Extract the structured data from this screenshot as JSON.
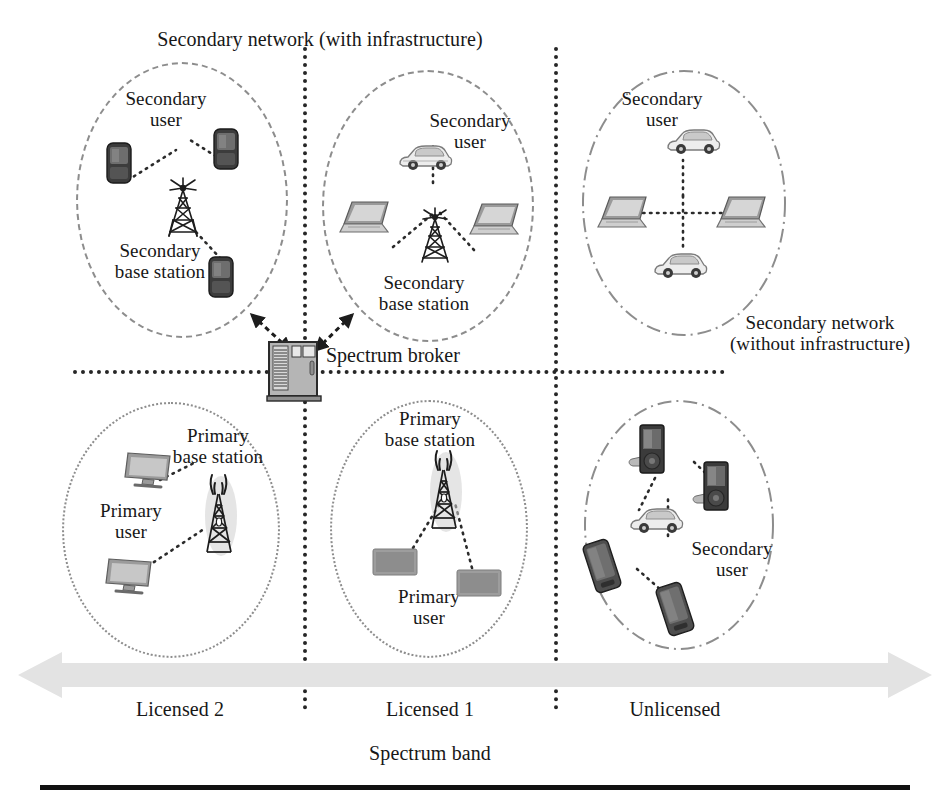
{
  "figure": {
    "title_top": "Secondary network (with infrastructure)",
    "axis_title": "Spectrum band",
    "broker_label": "Spectrum broker",
    "right_network_label": "Secondary network\n(without infrastructure)"
  },
  "bands": [
    {
      "id": "licensed-2",
      "label": "Licensed 2"
    },
    {
      "id": "licensed-1",
      "label": "Licensed 1"
    },
    {
      "id": "unlicensed",
      "label": "Unlicensed"
    }
  ],
  "cells": [
    {
      "id": "top-left",
      "band": "Licensed 2",
      "network_kind": "secondary-with-infrastructure",
      "labels": [
        {
          "id": "secondary-user",
          "text": "Secondary\nuser"
        },
        {
          "id": "secondary-base-station",
          "text": "Secondary\nbase station"
        }
      ],
      "nodes": [
        {
          "id": "phone-upper-left",
          "icon": "mobile-phone-icon"
        },
        {
          "id": "phone-upper-right",
          "icon": "mobile-phone-icon"
        },
        {
          "id": "phone-lower-right",
          "icon": "mobile-phone-icon"
        },
        {
          "id": "base-station",
          "icon": "antenna-tower-icon"
        }
      ]
    },
    {
      "id": "top-middle",
      "band": "Licensed 1",
      "network_kind": "secondary-with-infrastructure",
      "labels": [
        {
          "id": "secondary-user",
          "text": "Secondary\nuser"
        },
        {
          "id": "secondary-base-station",
          "text": "Secondary\nbase station"
        }
      ],
      "nodes": [
        {
          "id": "car-top",
          "icon": "car-icon"
        },
        {
          "id": "laptop-left",
          "icon": "laptop-icon"
        },
        {
          "id": "laptop-right",
          "icon": "laptop-icon"
        },
        {
          "id": "base-station",
          "icon": "antenna-tower-icon"
        }
      ]
    },
    {
      "id": "top-right",
      "band": "Unlicensed",
      "network_kind": "secondary-without-infrastructure",
      "labels": [
        {
          "id": "secondary-user",
          "text": "Secondary\nuser"
        }
      ],
      "nodes": [
        {
          "id": "car-top",
          "icon": "car-icon"
        },
        {
          "id": "laptop-left",
          "icon": "laptop-icon"
        },
        {
          "id": "laptop-right",
          "icon": "laptop-icon"
        },
        {
          "id": "car-bottom",
          "icon": "car-icon"
        }
      ]
    },
    {
      "id": "bottom-left",
      "band": "Licensed 2",
      "network_kind": "primary",
      "labels": [
        {
          "id": "primary-base-station",
          "text": "Primary\nbase station"
        },
        {
          "id": "primary-user",
          "text": "Primary\nuser"
        }
      ],
      "nodes": [
        {
          "id": "monitor-top",
          "icon": "monitor-icon"
        },
        {
          "id": "monitor-bottom",
          "icon": "monitor-icon"
        },
        {
          "id": "base-station",
          "icon": "broadcast-tower-icon"
        }
      ]
    },
    {
      "id": "bottom-middle",
      "band": "Licensed 1",
      "network_kind": "primary",
      "labels": [
        {
          "id": "primary-base-station",
          "text": "Primary\nbase station"
        },
        {
          "id": "primary-user",
          "text": "Primary\nuser"
        }
      ],
      "nodes": [
        {
          "id": "monitor-left",
          "icon": "monitor-icon"
        },
        {
          "id": "monitor-right",
          "icon": "monitor-icon"
        },
        {
          "id": "base-station",
          "icon": "broadcast-tower-icon"
        }
      ]
    },
    {
      "id": "bottom-right",
      "band": "Unlicensed",
      "network_kind": "secondary-without-infrastructure",
      "labels": [
        {
          "id": "secondary-user",
          "text": "Secondary\nuser"
        }
      ],
      "nodes": [
        {
          "id": "pda-top-left",
          "icon": "pda-device-icon"
        },
        {
          "id": "pda-top-right",
          "icon": "pda-device-icon"
        },
        {
          "id": "car-middle",
          "icon": "car-icon"
        },
        {
          "id": "phone-lower-left",
          "icon": "mobile-phone-icon"
        },
        {
          "id": "phone-lower-right",
          "icon": "mobile-phone-icon"
        }
      ]
    }
  ],
  "colors": {
    "ink": "#171717",
    "divider": "#262626",
    "ellipse": "#8d8d8d",
    "arrow_bar": "#e2e2e2",
    "rule": "#111111"
  }
}
